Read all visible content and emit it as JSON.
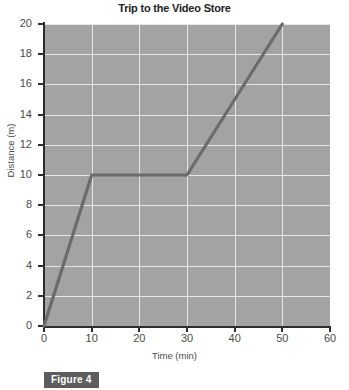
{
  "chart_data": {
    "type": "line",
    "title": "Trip to the Video Store",
    "xlabel": "Time (min)",
    "ylabel": "Distance (m)",
    "xlim": [
      0,
      60
    ],
    "ylim": [
      0,
      20
    ],
    "xticks": [
      0,
      10,
      20,
      30,
      40,
      50,
      60
    ],
    "yticks": [
      0,
      2,
      4,
      6,
      8,
      10,
      12,
      14,
      16,
      18,
      20
    ],
    "grid": true,
    "legend": null,
    "series": [
      {
        "name": "Trip",
        "x": [
          0,
          10,
          30,
          50
        ],
        "y": [
          0,
          10,
          10,
          20
        ],
        "color": "#6b6b6b"
      }
    ]
  },
  "caption": {
    "label": "Figure 4"
  },
  "colors": {
    "plot_background": "#a3a3a3",
    "gridline": "#e6e6e6",
    "axis": "#2e2e2e",
    "line": "#6b6b6b",
    "caption_background": "#5c5c5c",
    "caption_text": "#ffffff"
  }
}
